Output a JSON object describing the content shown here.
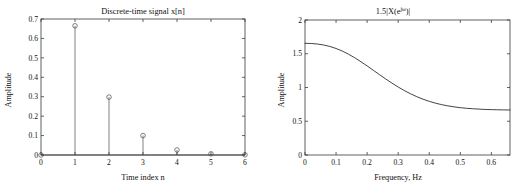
{
  "figure": {
    "background": "#ffffff",
    "axis_color": "#3b3b3b",
    "data_color": "#3a3a3a",
    "panel_count": 2
  },
  "chart_data": [
    {
      "id": "discrete-time-signal",
      "type": "scatter",
      "style": "stem",
      "title": "Discrete-time signal x[n]",
      "xlabel": "Time index n",
      "ylabel": "Amplitude",
      "xlim": [
        0,
        6
      ],
      "ylim": [
        0,
        0.7
      ],
      "grid": false,
      "legend": null,
      "xticks": [
        0,
        1,
        2,
        3,
        4,
        5,
        6
      ],
      "xticklabels": [
        "0",
        "1",
        "2",
        "3",
        "4",
        "5",
        "6"
      ],
      "yticks": [
        0,
        0.1,
        0.2,
        0.3,
        0.4,
        0.5,
        0.6,
        0.7
      ],
      "yticklabels": [
        "0",
        "0.1",
        "0.2",
        "0.3",
        "0.4",
        "0.5",
        "0.6",
        "0.7"
      ],
      "x": [
        0,
        1,
        2,
        3,
        4,
        5,
        6
      ],
      "values": [
        0,
        0.665,
        0.298,
        0.1,
        0.026,
        0.006,
        0.001
      ],
      "marker": "open-circle",
      "marker_size": 2.3
    },
    {
      "id": "magnitude-spectrum",
      "type": "line",
      "title": "1.5|X(e^{jw})|",
      "title_parts": {
        "prefix": "1.5|X(e",
        "exponent": "jω",
        "suffix": ")|"
      },
      "xlabel": "Frequency, Hz",
      "ylabel": "Amplitude",
      "xlim": [
        0,
        0.66
      ],
      "ylim": [
        0,
        2
      ],
      "grid": false,
      "legend": null,
      "xticks": [
        0,
        0.1,
        0.2,
        0.3,
        0.4,
        0.5,
        0.6
      ],
      "xticklabels": [
        "0",
        "0.1",
        "0.2",
        "0.3",
        "0.4",
        "0.5",
        "0.6"
      ],
      "yticks": [
        0,
        0.5,
        1,
        1.5,
        2
      ],
      "yticklabels": [
        "0",
        "0.5",
        "1",
        "1.5",
        "2"
      ],
      "x": [
        0.0,
        0.02,
        0.04,
        0.06,
        0.08,
        0.1,
        0.12,
        0.14,
        0.16,
        0.18,
        0.2,
        0.22,
        0.24,
        0.26,
        0.28,
        0.3,
        0.32,
        0.34,
        0.36,
        0.38,
        0.4,
        0.42,
        0.44,
        0.46,
        0.48,
        0.5,
        0.52,
        0.54,
        0.56,
        0.58,
        0.6,
        0.62,
        0.64,
        0.66
      ],
      "values": [
        1.655,
        1.652,
        1.644,
        1.63,
        1.608,
        1.578,
        1.54,
        1.494,
        1.441,
        1.382,
        1.32,
        1.255,
        1.19,
        1.126,
        1.065,
        1.007,
        0.954,
        0.906,
        0.864,
        0.827,
        0.795,
        0.768,
        0.746,
        0.728,
        0.713,
        0.701,
        0.692,
        0.685,
        0.68,
        0.675,
        0.672,
        0.67,
        0.668,
        0.667
      ]
    }
  ]
}
